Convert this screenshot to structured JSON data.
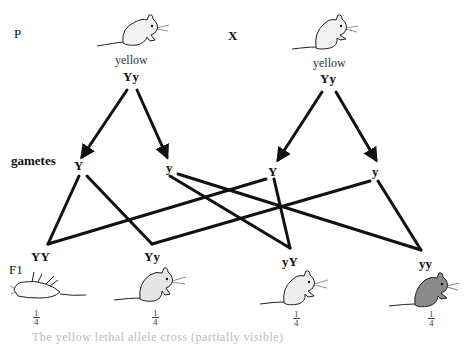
{
  "labels": {
    "parental": "P",
    "cross": "X",
    "gametes": "gametes",
    "f1": "F1"
  },
  "parents": [
    {
      "phenotype": "yellow",
      "genotype": "Yy",
      "icon": "mouse-yellow-icon"
    },
    {
      "phenotype": "yellow",
      "genotype": "Yy",
      "icon": "mouse-yellow-icon"
    }
  ],
  "gametes": [
    {
      "parent": 0,
      "allele": "Y"
    },
    {
      "parent": 0,
      "allele": "y"
    },
    {
      "parent": 1,
      "allele": "Y"
    },
    {
      "parent": 1,
      "allele": "y"
    }
  ],
  "offspring": [
    {
      "genotype": "YY",
      "fraction": {
        "num": "1",
        "den": "4"
      },
      "icon": "mouse-dead-icon",
      "color": "#ffffff"
    },
    {
      "genotype": "Yy",
      "fraction": {
        "num": "1",
        "den": "4"
      },
      "icon": "mouse-yellow-icon",
      "color": "#e6e6e6"
    },
    {
      "genotype": "yY",
      "fraction": {
        "num": "1",
        "den": "4"
      },
      "icon": "mouse-yellow-icon",
      "color": "#efefef"
    },
    {
      "genotype": "yy",
      "fraction": {
        "num": "1",
        "den": "4"
      },
      "icon": "mouse-agouti-icon",
      "color": "#8a8a8a"
    }
  ],
  "caption": "The yellow lethal allele cross (partially visible)",
  "colors": {
    "line": "#111111",
    "yellow_mouse": "#e8e8e8",
    "agouti_mouse": "#8a8a8a"
  }
}
